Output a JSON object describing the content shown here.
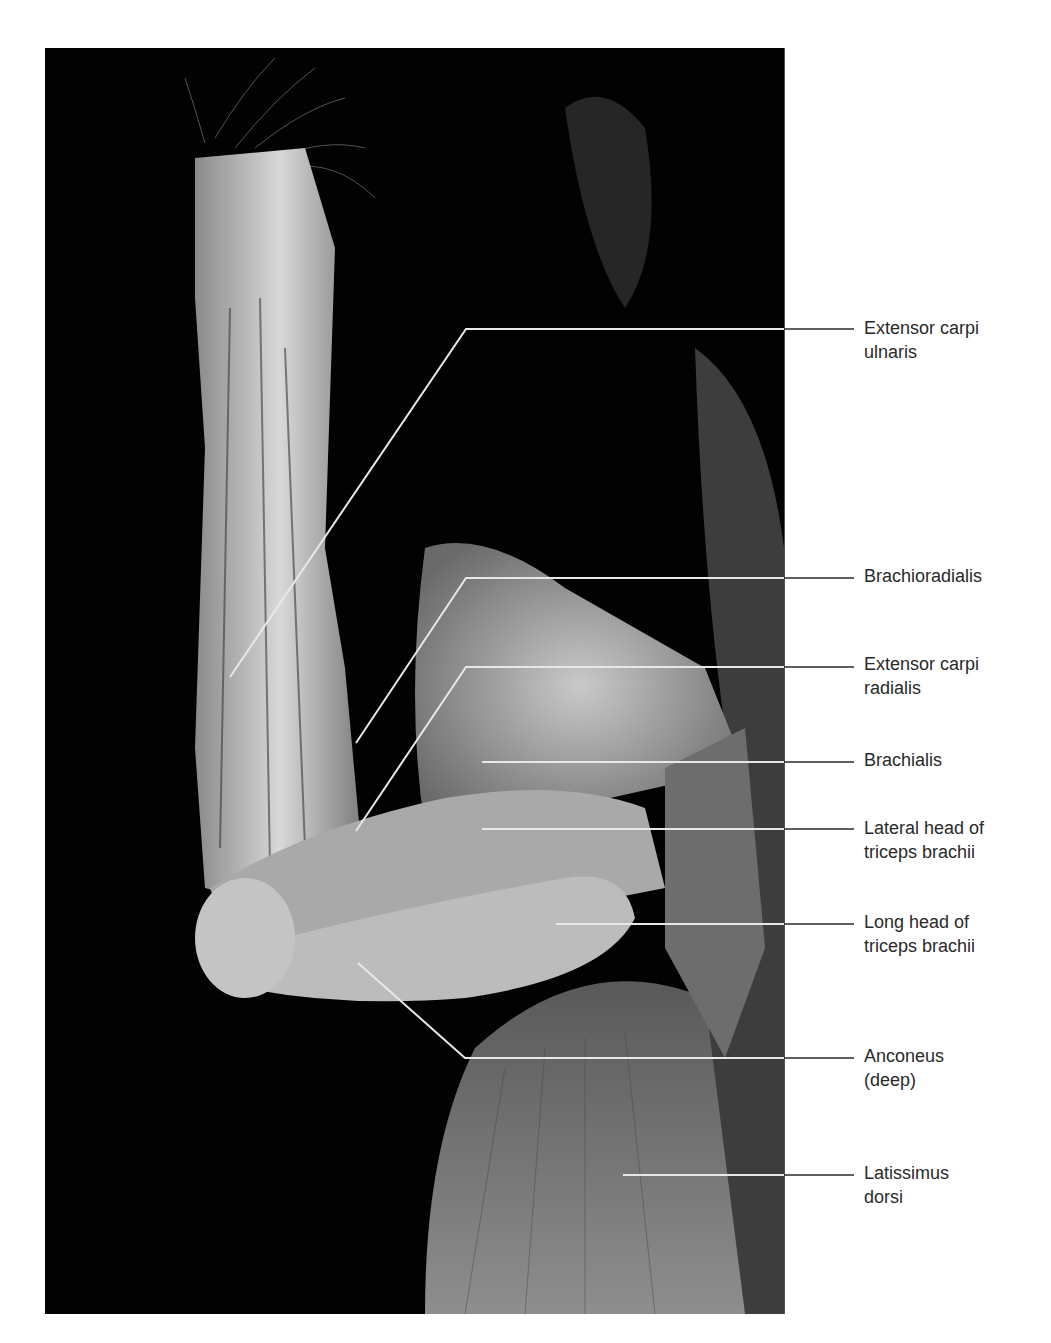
{
  "figure": {
    "background_color": "#020202",
    "line_color": "#e8e8e8"
  },
  "labels": [
    {
      "id": "extensor-carpi-ulnaris",
      "line1": "Extensor carpi",
      "line2": "ulnaris",
      "top": 316,
      "anchor": [
        230,
        677
      ],
      "bend": [
        466,
        329
      ],
      "y": 329
    },
    {
      "id": "brachioradialis",
      "line1": "Brachioradialis",
      "line2": "",
      "top": 564,
      "anchor": [
        356,
        743
      ],
      "bend": [
        466,
        578
      ],
      "y": 578
    },
    {
      "id": "extensor-carpi-radialis",
      "line1": "Extensor carpi",
      "line2": "radialis",
      "top": 652,
      "anchor": [
        356,
        831
      ],
      "bend": [
        466,
        667
      ],
      "y": 667
    },
    {
      "id": "brachialis",
      "line1": "Brachialis",
      "line2": "",
      "top": 746,
      "anchor": [
        482,
        762
      ],
      "bend": [
        482,
        762
      ],
      "y": 762
    },
    {
      "id": "lateral-head-triceps",
      "line1": "Lateral head of",
      "line2": "triceps brachii",
      "top": 816,
      "anchor": [
        482,
        829
      ],
      "bend": [
        482,
        829
      ],
      "y": 829
    },
    {
      "id": "long-head-triceps",
      "line1": "Long head of",
      "line2": "triceps brachii",
      "top": 910,
      "anchor": [
        556,
        924
      ],
      "bend": [
        556,
        924
      ],
      "y": 924
    },
    {
      "id": "anconeus",
      "line1": "Anconeus",
      "line2": "(deep)",
      "top": 1042,
      "anchor": [
        358,
        963
      ],
      "bend": [
        465,
        1058
      ],
      "y": 1058
    },
    {
      "id": "latissimus-dorsi",
      "line1": "Latissimus",
      "line2": "dorsi",
      "top": 1160,
      "anchor": [
        623,
        1175
      ],
      "bend": [
        623,
        1175
      ],
      "y": 1175
    }
  ],
  "leader_end_x": 854
}
